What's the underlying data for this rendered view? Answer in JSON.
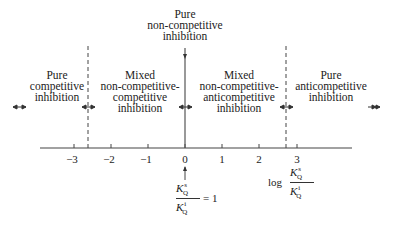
{
  "regions": [
    {
      "id": "pure-competitive",
      "lines": [
        "Pure",
        "competitive",
        "inhibition"
      ]
    },
    {
      "id": "mixed-noncomp-comp",
      "lines": [
        "Mixed",
        "non-competitive-",
        "competitive",
        "inhibition"
      ]
    },
    {
      "id": "pure-noncompetitive",
      "lines": [
        "Pure",
        "non-competitive",
        "inhibition"
      ]
    },
    {
      "id": "mixed-noncomp-anticomp",
      "lines": [
        "Mixed",
        "non-competitive-",
        "anticompetitive",
        "inhibition"
      ]
    },
    {
      "id": "pure-anticompetitive",
      "lines": [
        "Pure",
        "anticompetitive",
        "inhibition"
      ]
    }
  ],
  "axis": {
    "ticks": [
      "−3",
      "−2",
      "−1",
      "0",
      "1",
      "2",
      "3"
    ],
    "label_prefix": "log",
    "label_num": "K",
    "label_num_sup": "s",
    "label_num_sub": "Q",
    "label_den": "K",
    "label_den_sup": "i",
    "label_den_sub": "Q"
  },
  "zero_annotation": {
    "num": "K",
    "num_sup": "s",
    "num_sub": "Q",
    "den": "K",
    "den_sup": "i",
    "den_sub": "Q",
    "equals": "= 1"
  },
  "boundaries": {
    "left_dashed_value": -2.6,
    "center_solid_value": 0,
    "right_dashed_value": 2.7
  }
}
